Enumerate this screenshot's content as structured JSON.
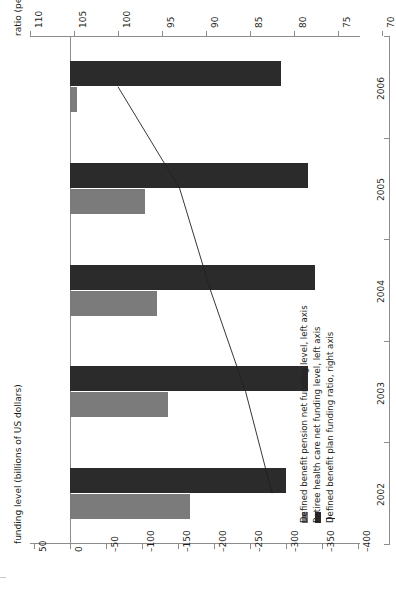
{
  "axes": {
    "ratio": {
      "title": "ratio (percent)",
      "ticks": [
        "110",
        "105",
        "100",
        "95",
        "90",
        "85",
        "80",
        "75",
        "70"
      ],
      "values": [
        110,
        105,
        100,
        95,
        90,
        85,
        80,
        75,
        70
      ],
      "min": 70,
      "max": 110
    },
    "funding": {
      "title": "funding level (billions of US dollars)",
      "ticks": [
        "50",
        "0",
        "–50",
        "–100",
        "–150",
        "–200",
        "–250",
        "–300",
        "–350",
        "–400"
      ],
      "values": [
        50,
        0,
        -50,
        -100,
        -150,
        -200,
        -250,
        -300,
        -350,
        -400
      ],
      "min": -400,
      "max": 50
    },
    "category": {
      "ticks": [
        "2002",
        "2003",
        "2004",
        "2005",
        "2006"
      ]
    }
  },
  "legend": {
    "items": [
      {
        "label": "Defined benefit pension net funding level, left axis",
        "marker": "swatch",
        "color": "#7b7b7b"
      },
      {
        "label": "Retiree health care net funding level, left axis",
        "marker": "swatch",
        "color": "#2b2b2b"
      },
      {
        "label": "Defined benefit plan funding ratio, right axis",
        "marker": "line",
        "color": "#231f20"
      }
    ]
  },
  "chart_data": {
    "type": "bar",
    "title": "",
    "xlabel": "funding level (billions of US dollars)",
    "ylabel": "ratio (percent)",
    "orientation": "horizontal-rotated",
    "categories": [
      "2002",
      "2003",
      "2004",
      "2005",
      "2006"
    ],
    "series": [
      {
        "name": "Defined benefit pension net funding level, left axis",
        "type": "bar",
        "color": "#7b7b7b",
        "axis": "left",
        "unit": "billions of US dollars",
        "values": [
          -166,
          -136,
          -121,
          -104,
          -10
        ]
      },
      {
        "name": "Retiree health care net funding level, left axis",
        "type": "bar",
        "color": "#2b2b2b",
        "axis": "left",
        "unit": "billions of US dollars",
        "values": [
          -300,
          -331,
          -340,
          -331,
          -293
        ]
      },
      {
        "name": "Defined benefit plan funding ratio, right axis",
        "type": "line",
        "color": "#231f20",
        "axis": "right",
        "unit": "percent",
        "values": [
          82.5,
          85.5,
          89.5,
          93.0,
          100.0
        ]
      }
    ],
    "ylim": [
      70,
      110
    ],
    "xlim": [
      -400,
      50
    ],
    "grid": false,
    "legend_position": "bottom-right"
  }
}
